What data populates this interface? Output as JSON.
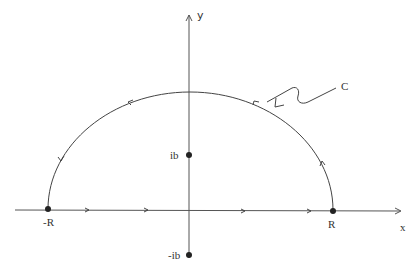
{
  "diagram": {
    "axes": {
      "x_label": "x",
      "y_label": "y"
    },
    "points": [
      {
        "id": "neg-R",
        "label": "-R"
      },
      {
        "id": "R",
        "label": "R"
      },
      {
        "id": "ib",
        "label": "ib"
      },
      {
        "id": "neg-ib",
        "label": "-ib"
      }
    ],
    "contour_label": "C",
    "colors": {
      "stroke": "#444444",
      "dot": "#222222",
      "text": "#333333",
      "background": "#ffffff"
    }
  }
}
